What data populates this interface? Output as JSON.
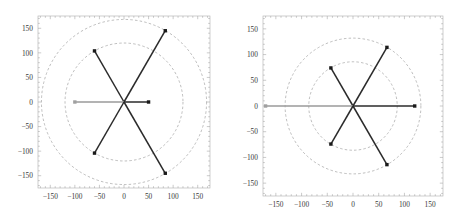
{
  "figure": {
    "title": "",
    "panel_count": 2,
    "background": "#ffffff"
  },
  "style": {
    "frame_color": "#b9b9b9",
    "tick_color": "#a8a8a8",
    "circle_color": "#9a9a9a",
    "ray_dark": "#2b2b2b",
    "ray_gray": "#9a9a9a",
    "marker_dark": "#1a1a1a",
    "marker_gray": "#a0a0a0",
    "label_color": "#3a3a3a"
  },
  "chart_data": [
    {
      "id": "left-panel",
      "type": "scatter",
      "title": "",
      "xlabel": "",
      "ylabel": "",
      "xlim": [
        -175,
        175
      ],
      "ylim": [
        -175,
        175
      ],
      "xticks": [
        -150,
        -100,
        -50,
        0,
        50,
        100,
        150
      ],
      "yticks": [
        -150,
        -100,
        -50,
        0,
        50,
        100,
        150
      ],
      "xtick_labels": [
        "-150",
        "-100",
        "-50",
        "0",
        "50",
        "100",
        "150"
      ],
      "ytick_labels": [
        "-150",
        "-100",
        "-50",
        "0",
        "50",
        "100",
        "150"
      ],
      "grid": false,
      "legend": "none",
      "reference_circles": [
        {
          "radius": 120,
          "style": "dashed"
        },
        {
          "radius": 168,
          "style": "dashed"
        }
      ],
      "rays": [
        {
          "angle_deg": 0,
          "radius": 50,
          "x": 50,
          "y": 0,
          "color": "dark"
        },
        {
          "angle_deg": 60,
          "radius": 168,
          "x": 84,
          "y": 145,
          "color": "dark"
        },
        {
          "angle_deg": 120,
          "radius": 120,
          "x": -60,
          "y": 104,
          "color": "dark"
        },
        {
          "angle_deg": 180,
          "radius": 100,
          "x": -100,
          "y": 0,
          "color": "gray"
        },
        {
          "angle_deg": 240,
          "radius": 120,
          "x": -60,
          "y": -104,
          "color": "dark"
        },
        {
          "angle_deg": 300,
          "radius": 168,
          "x": 84,
          "y": -145,
          "color": "dark"
        }
      ]
    },
    {
      "id": "right-panel",
      "type": "scatter",
      "title": "",
      "xlabel": "",
      "ylabel": "",
      "xlim": [
        -175,
        175
      ],
      "ylim": [
        -175,
        175
      ],
      "xticks": [
        -150,
        -100,
        -50,
        0,
        50,
        100,
        150
      ],
      "yticks": [
        -150,
        -100,
        -50,
        0,
        50,
        100,
        150
      ],
      "xtick_labels": [
        "-150",
        "-100",
        "-50",
        "0",
        "50",
        "100",
        "150"
      ],
      "ytick_labels": [
        "-150",
        "-100",
        "-50",
        "0",
        "50",
        "100",
        "150"
      ],
      "grid": false,
      "legend": "none",
      "reference_circles": [
        {
          "radius": 86,
          "style": "dashed"
        },
        {
          "radius": 132,
          "style": "dashed"
        }
      ],
      "rays": [
        {
          "angle_deg": 0,
          "radius": 120,
          "x": 120,
          "y": 0,
          "color": "dark"
        },
        {
          "angle_deg": 60,
          "radius": 132,
          "x": 66,
          "y": 114,
          "color": "dark"
        },
        {
          "angle_deg": 120,
          "radius": 86,
          "x": -43,
          "y": 74,
          "color": "dark"
        },
        {
          "angle_deg": 180,
          "radius": 170,
          "x": -170,
          "y": 0,
          "color": "gray"
        },
        {
          "angle_deg": 240,
          "radius": 86,
          "x": -43,
          "y": -74,
          "color": "dark"
        },
        {
          "angle_deg": 300,
          "radius": 132,
          "x": 66,
          "y": -114,
          "color": "dark"
        }
      ]
    }
  ]
}
